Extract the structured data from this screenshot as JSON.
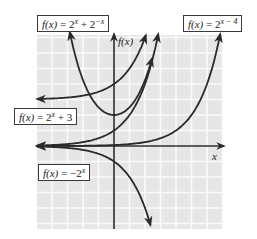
{
  "chart_data": {
    "type": "line",
    "title": "",
    "xlabel": "x",
    "ylabel": "f(x)",
    "xlim": [
      -5,
      7
    ],
    "ylim": [
      -5.3,
      7.2
    ],
    "grid": true,
    "legend_position": "inline labels",
    "series": [
      {
        "name": "f(x) = 2^x + 2^-x",
        "expr": "2^x + 2^(-x)",
        "points": [
          [
            -2.9,
            7.5
          ],
          [
            -2,
            4.25
          ],
          [
            -1,
            2.5
          ],
          [
            0,
            2
          ],
          [
            1,
            2.5
          ],
          [
            2,
            4.25
          ],
          [
            2.9,
            7.5
          ]
        ]
      },
      {
        "name": "f(x) = 2^(x-4)",
        "expr": "2^(x-4)",
        "points": [
          [
            -5,
            0.002
          ],
          [
            0,
            0.0625
          ],
          [
            2,
            0.25
          ],
          [
            4,
            1
          ],
          [
            5,
            2
          ],
          [
            6,
            4
          ],
          [
            6.9,
            7.5
          ]
        ]
      },
      {
        "name": "f(x) = 2^x + 3",
        "expr": "2^x + 3",
        "points": [
          [
            -5,
            3.03
          ],
          [
            -2,
            3.25
          ],
          [
            0,
            4
          ],
          [
            1,
            5
          ],
          [
            2,
            7
          ]
        ]
      },
      {
        "name": "f(x) = 2^x",
        "expr": "2^x",
        "points": [
          [
            -5,
            0.03
          ],
          [
            0,
            1
          ],
          [
            1,
            2
          ],
          [
            2,
            4
          ],
          [
            2.9,
            7.5
          ]
        ]
      },
      {
        "name": "f(x) = -2^x",
        "expr": "-(2^x)",
        "points": [
          [
            -5,
            -0.03
          ],
          [
            0,
            -1
          ],
          [
            1,
            -2
          ],
          [
            2,
            -4
          ],
          [
            2.3,
            -5
          ]
        ]
      }
    ],
    "annotations": [
      "f(x) = 2^x + 2^-x",
      "f(x) = 2^(x-4)",
      "f(x) = 2^x + 3",
      "f(x) = -2^x"
    ]
  },
  "labels": {
    "top_left": {
      "fx": "f(x)",
      "eq": " = 2",
      "sup1": "x",
      "mid": " + 2",
      "sup2": "−x"
    },
    "top_right": {
      "fx": "f(x)",
      "eq": " = 2",
      "sup1": "x − 4"
    },
    "mid_left": {
      "fx": "f(x)",
      "eq": " = 2",
      "sup1": "x",
      "mid": " + 3"
    },
    "bottom_left": {
      "fx": "f(x)",
      "eq": " = −2",
      "sup1": "x"
    },
    "y_axis": "f(x)",
    "x_axis": "x"
  },
  "colors": {
    "grid_bg": "#e6e6e6",
    "grid_line": "#fafafa",
    "curve": "#2a2a2a",
    "axis": "#2a2a2a"
  }
}
